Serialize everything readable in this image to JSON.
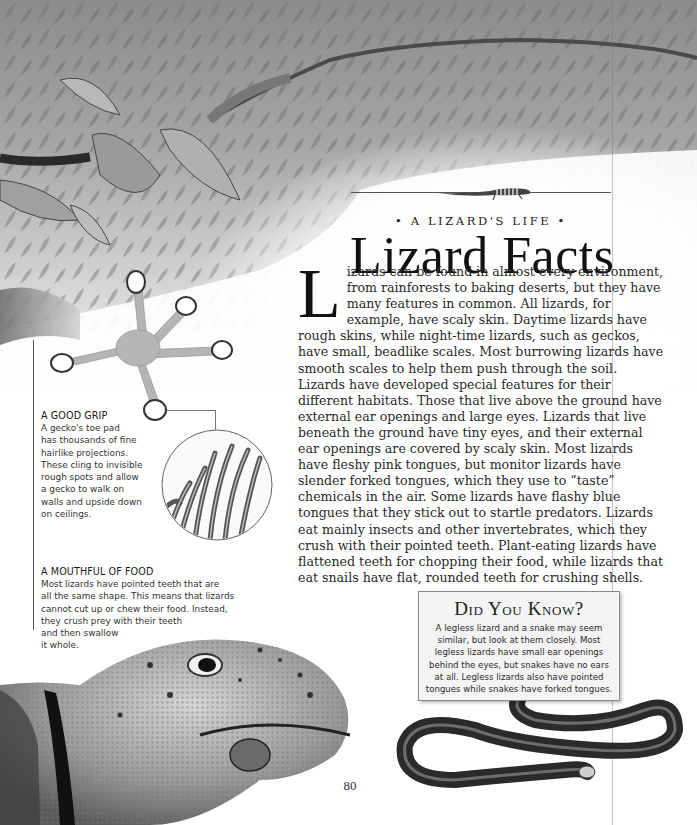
{
  "header": {
    "kicker": "• A LIZARD'S LIFE •",
    "title": "Lizard Facts"
  },
  "body": {
    "drop_cap": "L",
    "text": "izards can be found in almost every environment, from rainforests to baking deserts, but they have many features in common. All lizards, for example, have scaly skin. Daytime lizards have rough skins, while night-time lizards, such as geckos, have small, beadlike scales. Most burrowing lizards have smooth scales to help them push through the soil. Lizards have developed special features for their different habitats. Those that live above the ground have external ear openings and large eyes. Lizards that live beneath the ground have tiny eyes, and their external ear openings are covered by scaly skin. Most lizards have fleshy pink tongues, but monitor lizards have slender forked tongues, which they use to “taste” chemicals in the air. Some lizards have flashy blue tongues that they stick out to startle predators. Lizards eat mainly insects and other invertebrates, which they crush with their pointed teeth. Plant-eating lizards have flattened teeth for chopping their food, while lizards that eat snails have flat, rounded teeth for crushing shells."
  },
  "captions": {
    "grip": {
      "title": "A GOOD GRIP",
      "text": "A gecko's toe pad\nhas thousands of fine\nhairlike projections.\nThese cling to invisible\nrough spots and allow\na gecko to walk on\nwalls and upside down\non ceilings."
    },
    "mouth": {
      "title": "A MOUTHFUL OF FOOD",
      "text": "Most lizards have pointed teeth that are\nall the same shape. This means that lizards\ncannot cut up or chew their food. Instead,\nthey crush prey with their teeth\nand then swallow\nit whole."
    }
  },
  "did_you_know": {
    "title": "Did You Know?",
    "text": "A legless lizard and a snake may seem\nsimilar, but look at them closely. Most\nlegless lizards have small ear openings\nbehind the eyes, but snakes have no ears\nat all. Legless lizards also have pointed\ntongues while snakes have forked tongues."
  },
  "illustrations": {
    "foliage": "rainforest-foliage-illustration",
    "mini_lizard": "striped-lizard-ornament",
    "gecko_foot": "gecko-foot-illustration",
    "toe_pad_inset": "toe-pad-hairs-magnified",
    "lizard_head": "collared-lizard-eating-insect-photo",
    "snake": "legless-lizard-photo"
  },
  "footer": {
    "page_number": "80"
  },
  "colors": {
    "text": "#2a2a2a",
    "title": "#111111",
    "box_bg": "#f4f4f4",
    "box_border": "#8a8a8a"
  }
}
